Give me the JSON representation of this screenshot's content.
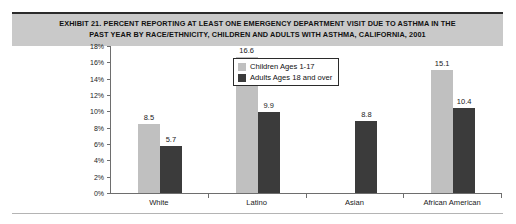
{
  "title": "EXHIBIT 21. PERCENT REPORTING AT LEAST ONE EMERGENCY DEPARTMENT VISIT DUE TO ASTHMA IN THE\nPAST YEAR BY RACE/ETHNICITY, CHILDREN AND ADULTS WITH ASTHMA, CALIFORNIA, 2001",
  "colors": {
    "children_bar": "#c0c0c0",
    "adults_bar": "#3b3b3b",
    "title_band": "#c9c9c9",
    "axis": "#6e6e6e"
  },
  "chart_data": {
    "type": "bar",
    "title": "EXHIBIT 21. PERCENT REPORTING AT LEAST ONE EMERGENCY DEPARTMENT VISIT DUE TO ASTHMA IN THE PAST YEAR BY RACE/ETHNICITY, CHILDREN AND ADULTS WITH ASTHMA, CALIFORNIA, 2001",
    "xlabel": "",
    "ylabel": "",
    "ylim": [
      0,
      18
    ],
    "ytick_labels": [
      "18%",
      "16%",
      "14%",
      "12%",
      "10%",
      "8%",
      "6%",
      "4%",
      "2%",
      "0%"
    ],
    "ytick_values": [
      18,
      16,
      14,
      12,
      10,
      8,
      6,
      4,
      2,
      0
    ],
    "grid": false,
    "legend_position": "inside-top-center",
    "categories": [
      "White",
      "Latino",
      "Asian",
      "African American"
    ],
    "series": [
      {
        "name": "Children Ages 1-17",
        "color": "#c0c0c0",
        "values": [
          8.5,
          16.6,
          null,
          15.1
        ],
        "labels": [
          "8.5",
          "16.6",
          "",
          "15.1"
        ]
      },
      {
        "name": "Adults Ages 18 and over",
        "color": "#3b3b3b",
        "values": [
          5.7,
          9.9,
          8.8,
          10.4
        ],
        "labels": [
          "5.7",
          "9.9",
          "8.8",
          "10.4"
        ]
      }
    ]
  },
  "legend": {
    "items": [
      {
        "label": "Children Ages 1-17",
        "swatch": "children"
      },
      {
        "label": "Adults Ages 18 and over",
        "swatch": "adults"
      }
    ]
  }
}
